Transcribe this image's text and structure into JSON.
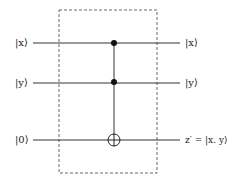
{
  "diagram": {
    "type": "quantum-circuit",
    "gate": "Toffoli (CCNOT)",
    "inputs": [
      "|x⟩",
      "|y⟩",
      "|0⟩"
    ],
    "outputs": [
      "|x⟩",
      "|y⟩",
      "z′ = |x. y⟩"
    ],
    "wires": [
      {
        "input": "|x⟩",
        "output": "|x⟩",
        "role": "control"
      },
      {
        "input": "|y⟩",
        "output": "|y⟩",
        "role": "control"
      },
      {
        "input": "|0⟩",
        "output": "z′ = |x. y⟩",
        "role": "target"
      }
    ],
    "colors": {
      "line": "#333333",
      "box": "#555555",
      "background": "#ffffff"
    }
  }
}
